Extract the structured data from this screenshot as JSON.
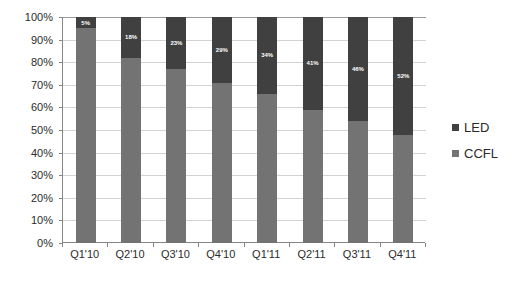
{
  "chart_data": {
    "type": "bar",
    "subtype": "100-percent-stacked-column",
    "title": "",
    "subtitle": "",
    "xlabel": "",
    "ylabel": "",
    "categories": [
      "Q1'10",
      "Q2'10",
      "Q3'10",
      "Q4'10",
      "Q1'11",
      "Q2'11",
      "Q3'11",
      "Q4'11"
    ],
    "series": [
      {
        "name": "LED",
        "color": "#404040",
        "values": [
          5,
          18,
          23,
          29,
          34,
          41,
          46,
          52
        ],
        "labels": [
          "5%",
          "18%",
          "23%",
          "29%",
          "34%",
          "41%",
          "46%",
          "52%"
        ],
        "labels_shown": true
      },
      {
        "name": "CCFL",
        "color": "#737373",
        "values": [
          95,
          82,
          77,
          71,
          66,
          59,
          54,
          48
        ],
        "labels": [
          "95%",
          "82%",
          "77%",
          "71%",
          "66%",
          "59%",
          "54%",
          "48%"
        ],
        "labels_shown": false
      }
    ],
    "ylim": [
      0,
      100
    ],
    "ytick_step": 10,
    "ytick_labels": [
      "100%",
      "90%",
      "80%",
      "70%",
      "60%",
      "50%",
      "40%",
      "30%",
      "20%",
      "10%",
      "0%"
    ],
    "ytick_values": [
      100,
      90,
      80,
      70,
      60,
      50,
      40,
      30,
      20,
      10,
      0
    ],
    "grid": {
      "horizontal": true,
      "vertical": false,
      "color": "#d2d2d2"
    },
    "legend": {
      "position": "right",
      "entries": [
        {
          "label": "LED",
          "color": "#404040"
        },
        {
          "label": "CCFL",
          "color": "#737373"
        }
      ]
    },
    "stack_order_top_to_bottom": [
      "LED",
      "CCFL"
    ],
    "axis_color": "#868686",
    "background": "#ffffff",
    "text_color": "#2b2b2b"
  }
}
